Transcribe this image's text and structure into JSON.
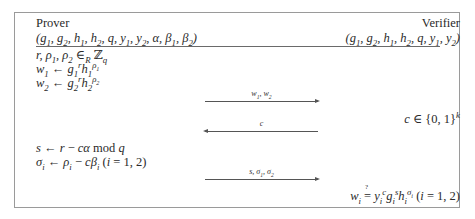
{
  "prover": {
    "title": "Prover",
    "params": "(g₁, g₂, h₁, h₂, q, y₁, y₂, α, β₁, β₂)",
    "steps": [
      "r, ρ₁, ρ₂ ∈R ℤq",
      "w₁ ← g₁ʳ h₁^ρ₁",
      "w₂ ← g₂ʳ h₂^ρ₂"
    ],
    "response": [
      "s ← r − cα mod q",
      "σᵢ ← ρᵢ − cβᵢ (i = 1, 2)"
    ]
  },
  "verifier": {
    "title": "Verifier",
    "params": "(g₁, g₂, h₁, h₂, q, y₁, y₂)",
    "challenge": "c ∈ {0, 1}ᵏ",
    "check": "wᵢ ≟ yᵢᶜ gᵢˢ hᵢ^σᵢ (i = 1, 2)"
  },
  "messages": [
    {
      "label": "w₁, w₂",
      "direction": "right"
    },
    {
      "label": "c",
      "direction": "left"
    },
    {
      "label": "s, σ₁, σ₂",
      "direction": "right"
    }
  ]
}
